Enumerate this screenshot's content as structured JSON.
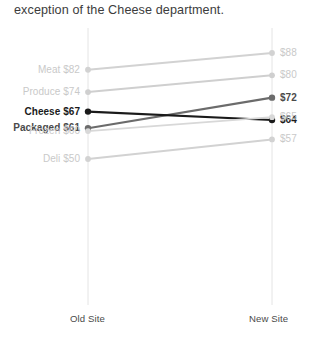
{
  "title": "exception of the Cheese department.",
  "axis": {
    "left_label": "Old Site",
    "right_label": "New Site"
  },
  "chart_data": {
    "type": "line",
    "subtype": "slope-chart",
    "title": "exception of the Cheese department.",
    "xlabel": "",
    "ylabel": "",
    "categories": [
      "Old Site",
      "New Site"
    ],
    "x": [
      "Old Site",
      "New Site"
    ],
    "grid": false,
    "vertical_axis_lines": true,
    "legend": "none",
    "value_prefix": "$",
    "ylim": [
      45,
      92
    ],
    "series": [
      {
        "name": "Meat",
        "values": [
          82,
          88
        ],
        "left_label": "Meat $82",
        "right_label": "$88",
        "color": "#d2d2d2",
        "emphasis": "faint"
      },
      {
        "name": "Produce",
        "values": [
          74,
          80
        ],
        "left_label": "Produce $74",
        "right_label": "$80",
        "color": "#cfcfcf",
        "emphasis": "faint"
      },
      {
        "name": "Packaged",
        "values": [
          61,
          72
        ],
        "left_label": "Packaged $61",
        "right_label": "$72",
        "color": "#6b6b6b",
        "emphasis": "mid"
      },
      {
        "name": "Cheese",
        "values": [
          67,
          64
        ],
        "left_label": "Cheese $67",
        "right_label": "$64",
        "color": "#1a1a1a",
        "emphasis": "dark"
      },
      {
        "name": "Frozen",
        "values": [
          60,
          65
        ],
        "left_label": "Frozen $60",
        "right_label": "$65",
        "color": "#d8d8d8",
        "emphasis": "faint"
      },
      {
        "name": "Deli",
        "values": [
          50,
          57
        ],
        "left_label": "Deli $50",
        "right_label": "$57",
        "color": "#d2d2d2",
        "emphasis": "faint"
      }
    ]
  }
}
